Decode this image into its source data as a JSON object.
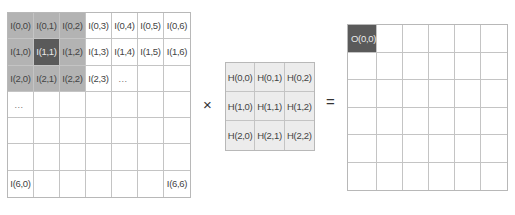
{
  "input_grid": {
    "rows": 7,
    "cols": 7,
    "cells": [
      [
        "I(0,0)",
        "I(0,1)",
        "I(0,2)",
        "I(0,3)",
        "I(0,4)",
        "I(0,5)",
        "I(0,6)"
      ],
      [
        "I(1,0)",
        "I(1,1)",
        "I(1,2)",
        "I(1,3)",
        "I(1,4)",
        "I(1,5)",
        "I(1,6)"
      ],
      [
        "I(2,0)",
        "I(2,1)",
        "I(2,2)",
        "I(2,3)",
        "...",
        "",
        ""
      ],
      [
        "...",
        "",
        "",
        "",
        "",
        "",
        ""
      ],
      [
        "",
        "",
        "",
        "",
        "",
        "",
        ""
      ],
      [
        "",
        "",
        "",
        "",
        "",
        "",
        ""
      ],
      [
        "I(6,0)",
        "",
        "",
        "",
        "",
        "",
        "I(6,6)"
      ]
    ],
    "shaded": [
      [
        0,
        0
      ],
      [
        0,
        1
      ],
      [
        0,
        2
      ],
      [
        1,
        0
      ],
      [
        1,
        2
      ],
      [
        2,
        0
      ],
      [
        2,
        1
      ],
      [
        2,
        2
      ]
    ],
    "highlight": [
      1,
      1
    ]
  },
  "operator_multiply": "×",
  "kernel_grid": {
    "rows": 3,
    "cols": 3,
    "cells": [
      [
        "H(0,0)",
        "H(0,1)",
        "H(0,2)"
      ],
      [
        "H(1,0)",
        "H(1,1)",
        "H(1,2)"
      ],
      [
        "H(2,0)",
        "H(2,1)",
        "H(2,2)"
      ]
    ]
  },
  "operator_equals": "=",
  "output_grid": {
    "rows": 6,
    "cols": 6,
    "cells": [
      [
        "O(0,0)",
        "",
        "",
        "",
        "",
        ""
      ],
      [
        "",
        "",
        "",
        "",
        "",
        ""
      ],
      [
        "",
        "",
        "",
        "",
        "",
        ""
      ],
      [
        "",
        "",
        "",
        "",
        "",
        ""
      ],
      [
        "",
        "",
        "",
        "",
        "",
        ""
      ],
      [
        "",
        "",
        "",
        "",
        "",
        ""
      ]
    ],
    "highlight": [
      0,
      0
    ]
  },
  "colors": {
    "shade": "#b3b3b3",
    "highlight": "#5a5a5a",
    "kernel_bg": "#ececec",
    "grid_line": "#c4c4c4"
  }
}
